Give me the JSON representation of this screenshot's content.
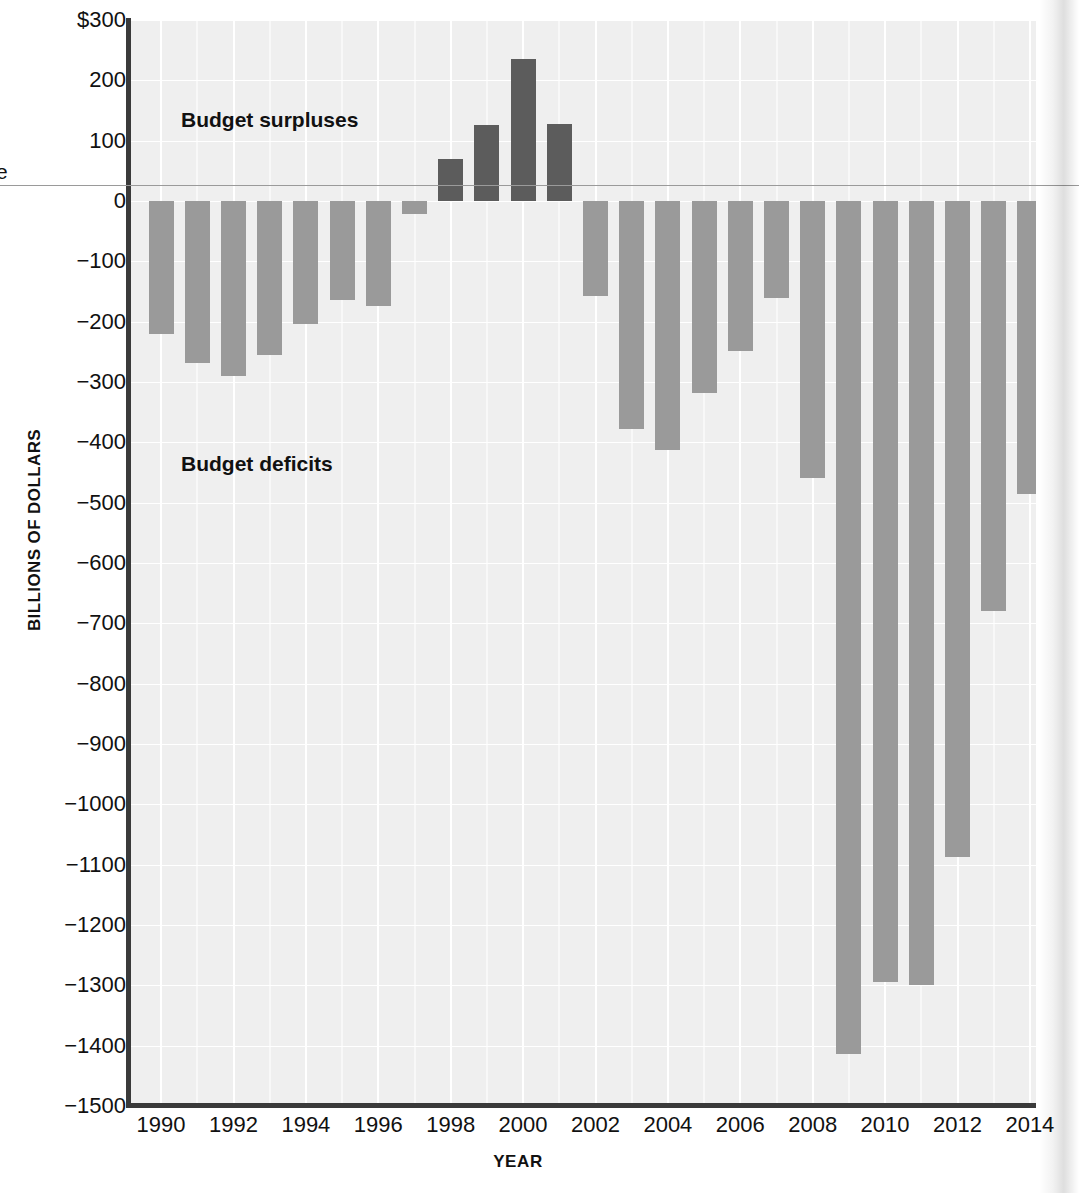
{
  "axes": {
    "x_title": "YEAR",
    "y_title": "BILLIONS OF DOLLARS",
    "y_ticks": [
      "$300",
      "200",
      "100",
      "0",
      "−100",
      "−200",
      "−300",
      "−400",
      "−500",
      "−600",
      "−700",
      "−800",
      "−900",
      "−1000",
      "−1100",
      "−1200",
      "−1300",
      "−1400",
      "−1500"
    ],
    "x_ticks": [
      "1990",
      "1992",
      "1994",
      "1996",
      "1998",
      "2000",
      "2002",
      "2004",
      "2006",
      "2008",
      "2010",
      "2012",
      "2014"
    ]
  },
  "annotations": {
    "surpluses": "Budget surpluses",
    "deficits": "Budget deficits",
    "margin_fragment": "e"
  },
  "colors": {
    "plot_background": "#efefef",
    "gridline": "#ffffff",
    "axis": "#3a3a3a",
    "deficit_bar": "#9a9a9a",
    "surplus_bar": "#5c5c5c",
    "text": "#111111"
  },
  "chart_data": {
    "type": "bar",
    "title": "",
    "xlabel": "YEAR",
    "ylabel": "BILLIONS OF DOLLARS",
    "ylim": [
      -1500,
      300
    ],
    "ytick_values": [
      300,
      200,
      100,
      0,
      -100,
      -200,
      -300,
      -400,
      -500,
      -600,
      -700,
      -800,
      -900,
      -1000,
      -1100,
      -1200,
      -1300,
      -1400,
      -1500
    ],
    "xtick_values": [
      1990,
      1992,
      1994,
      1996,
      1998,
      2000,
      2002,
      2004,
      2006,
      2008,
      2010,
      2012,
      2014
    ],
    "grid": true,
    "legend": "none",
    "categories": [
      1990,
      1991,
      1992,
      1993,
      1994,
      1995,
      1996,
      1997,
      1998,
      1999,
      2000,
      2001,
      2002,
      2003,
      2004,
      2005,
      2006,
      2007,
      2008,
      2009,
      2010,
      2011,
      2012,
      2013,
      2014
    ],
    "values": [
      -221,
      -269,
      -290,
      -255,
      -203,
      -164,
      -174,
      -22,
      69,
      126,
      236,
      128,
      -158,
      -378,
      -413,
      -318,
      -248,
      -161,
      -459,
      -1413,
      -1294,
      -1300,
      -1087,
      -680,
      -485
    ],
    "annotations": [
      "Budget surpluses",
      "Budget deficits"
    ],
    "bar_groups": [
      {
        "name": "Budget deficits",
        "color": "#9a9a9a",
        "sign": "negative"
      },
      {
        "name": "Budget surpluses",
        "color": "#5c5c5c",
        "sign": "positive"
      }
    ]
  }
}
